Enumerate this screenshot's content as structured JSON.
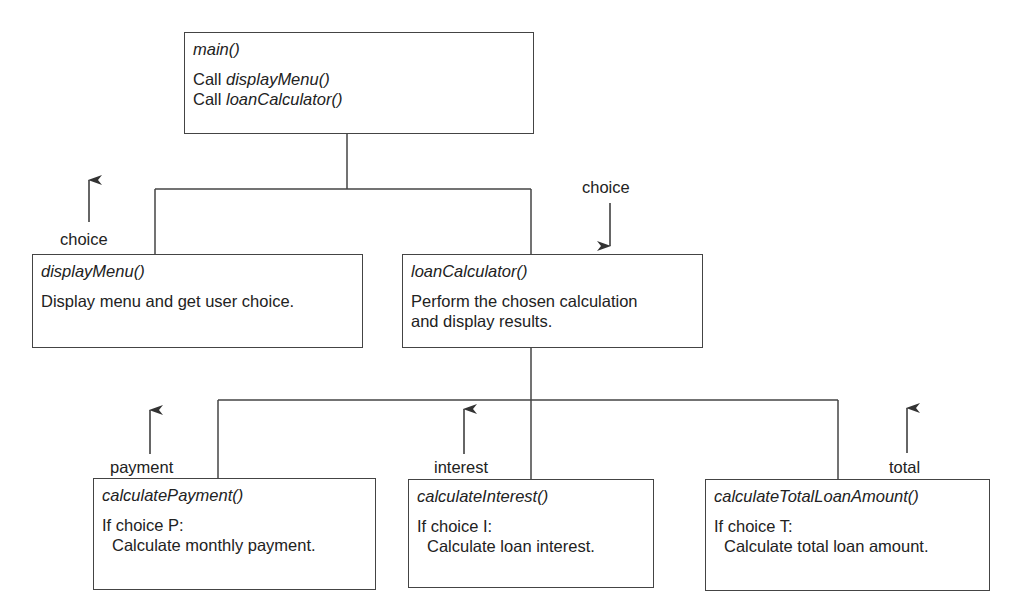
{
  "diagram": {
    "type": "structure-chart",
    "nodes": {
      "main": {
        "title": "main()",
        "lines": [
          {
            "prefix": "Call ",
            "call": "displayMenu()"
          },
          {
            "prefix": "Call ",
            "call": "loanCalculator()"
          }
        ]
      },
      "displayMenu": {
        "title": "displayMenu()",
        "lines": [
          "Display menu and get user choice."
        ]
      },
      "loanCalculator": {
        "title": "loanCalculator()",
        "lines": [
          "Perform the chosen calculation",
          "and display results."
        ]
      },
      "calculatePayment": {
        "title": "calculatePayment()",
        "lines": [
          "If choice P:",
          "Calculate monthly payment."
        ]
      },
      "calculateInterest": {
        "title": "calculateInterest()",
        "lines": [
          "If choice I:",
          "Calculate loan interest."
        ]
      },
      "calculateTotalLoanAmount": {
        "title": "calculateTotalLoanAmount()",
        "lines": [
          "If choice T:",
          "Calculate total loan amount."
        ]
      }
    },
    "flows": [
      {
        "label": "choice",
        "from": "displayMenu",
        "direction": "up"
      },
      {
        "label": "choice",
        "to": "loanCalculator",
        "direction": "down"
      },
      {
        "label": "payment",
        "from": "calculatePayment",
        "direction": "up"
      },
      {
        "label": "interest",
        "from": "calculateInterest",
        "direction": "up"
      },
      {
        "label": "total",
        "from": "calculateTotalLoanAmount",
        "direction": "up"
      }
    ],
    "edges": [
      {
        "from": "main",
        "to": "displayMenu"
      },
      {
        "from": "main",
        "to": "loanCalculator"
      },
      {
        "from": "loanCalculator",
        "to": "calculatePayment"
      },
      {
        "from": "loanCalculator",
        "to": "calculateInterest"
      },
      {
        "from": "loanCalculator",
        "to": "calculateTotalLoanAmount"
      }
    ],
    "colors": {
      "line": "#444444",
      "text": "#222222",
      "background": "#ffffff"
    }
  }
}
